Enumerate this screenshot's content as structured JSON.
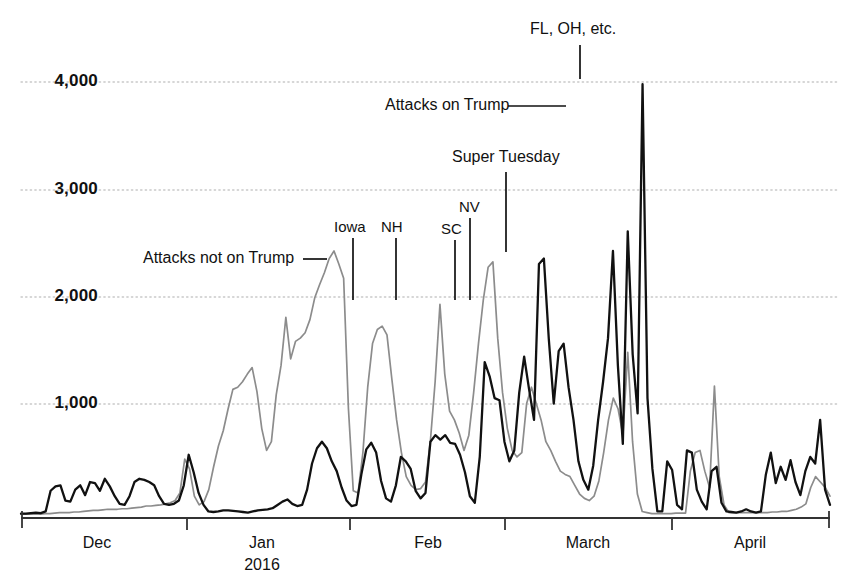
{
  "chart_data": {
    "type": "line",
    "title": "",
    "subtitle": "",
    "xlabel": "",
    "ylabel": "",
    "ylim": [
      0,
      4250
    ],
    "xlim": [
      0,
      160
    ],
    "grid": true,
    "legend_position": "inline-annotations",
    "y_ticks": [
      "1,000",
      "2,000",
      "3,000",
      "4,000"
    ],
    "y_tick_values": [
      1000,
      2000,
      3000,
      4000
    ],
    "x_ticks": [
      "Dec",
      "Jan",
      "Feb",
      "March",
      "April"
    ],
    "x_tick_sub": "2016",
    "x_tick_index": [
      6,
      37,
      68,
      97,
      128
    ],
    "colors": {
      "attacks_on_trump": "#111111",
      "attacks_not_on_trump": "#8c8c8c",
      "grid": "#c9c9c9",
      "axis": "#333333"
    },
    "series": [
      {
        "name": "Attacks on Trump",
        "color": "#111111",
        "values": [
          40,
          40,
          45,
          50,
          45,
          60,
          250,
          290,
          300,
          160,
          150,
          260,
          300,
          210,
          330,
          320,
          250,
          360,
          290,
          200,
          130,
          120,
          200,
          330,
          360,
          350,
          330,
          300,
          200,
          130,
          120,
          130,
          160,
          300,
          580,
          420,
          230,
          120,
          60,
          55,
          60,
          70,
          70,
          65,
          60,
          55,
          50,
          60,
          70,
          75,
          80,
          90,
          120,
          150,
          170,
          130,
          110,
          120,
          260,
          500,
          640,
          700,
          640,
          520,
          430,
          280,
          160,
          110,
          120,
          400,
          630,
          690,
          600,
          340,
          180,
          150,
          300,
          560,
          520,
          450,
          250,
          180,
          230,
          700,
          760,
          720,
          760,
          690,
          680,
          580,
          420,
          200,
          140,
          560,
          1430,
          1300,
          1100,
          1080,
          700,
          520,
          620,
          1150,
          1480,
          1180,
          900,
          2330,
          2380,
          1640,
          1050,
          1530,
          1600,
          1200,
          900,
          520,
          350,
          260,
          480,
          900,
          1250,
          1650,
          2450,
          1400,
          680,
          2630,
          1500,
          960,
          3980,
          1100,
          450,
          60,
          60,
          520,
          440,
          120,
          80,
          620,
          600,
          260,
          150,
          80,
          430,
          470,
          140,
          60,
          55,
          50,
          60,
          80,
          60,
          50,
          60,
          400,
          600,
          320,
          470,
          350,
          530,
          330,
          210,
          430,
          560,
          500,
          900,
          260,
          120
        ]
      },
      {
        "name": "Attacks not on Trump",
        "color": "#8c8c8c",
        "values": [
          35,
          35,
          35,
          35,
          35,
          40,
          40,
          45,
          50,
          50,
          50,
          55,
          55,
          60,
          65,
          70,
          70,
          75,
          80,
          80,
          80,
          85,
          85,
          90,
          95,
          100,
          110,
          110,
          115,
          120,
          130,
          140,
          160,
          230,
          540,
          450,
          200,
          120,
          150,
          260,
          470,
          660,
          800,
          1000,
          1180,
          1200,
          1250,
          1320,
          1380,
          1160,
          820,
          620,
          700,
          1130,
          1400,
          1840,
          1460,
          1620,
          1650,
          1700,
          1820,
          2020,
          2140,
          2250,
          2380,
          2450,
          2330,
          2200,
          1000,
          250,
          230,
          600,
          1200,
          1600,
          1730,
          1760,
          1680,
          1280,
          900,
          600,
          380,
          300,
          260,
          270,
          330,
          700,
          1250,
          1960,
          1320,
          980,
          900,
          780,
          620,
          760,
          1150,
          1600,
          2000,
          2300,
          2350,
          1650,
          1150,
          820,
          620,
          560,
          600,
          1050,
          1200,
          1050,
          900,
          700,
          620,
          520,
          430,
          400,
          380,
          300,
          220,
          180,
          160,
          200,
          340,
          600,
          900,
          1100,
          1000,
          760,
          1520,
          700,
          220,
          60,
          50,
          40,
          40,
          40,
          40,
          40,
          45,
          45,
          45,
          430,
          600,
          620,
          430,
          280,
          1210,
          380,
          120,
          50,
          50,
          50,
          50,
          50,
          50,
          50,
          50,
          50,
          55,
          55,
          60,
          60,
          70,
          80,
          100,
          130,
          280,
          380,
          330,
          280,
          200
        ]
      }
    ],
    "annotations": [
      {
        "id": "fl-oh-etc",
        "text": "FL, OH, etc.",
        "leader": "vertical"
      },
      {
        "id": "attacks-on-trump",
        "text": "Attacks on Trump",
        "leader": "horizontal"
      },
      {
        "id": "super-tuesday",
        "text": "Super Tuesday",
        "leader": "vertical"
      },
      {
        "id": "nv",
        "text": "NV",
        "leader": "vertical"
      },
      {
        "id": "sc",
        "text": "SC",
        "leader": "vertical"
      },
      {
        "id": "nh",
        "text": "NH",
        "leader": "vertical"
      },
      {
        "id": "iowa",
        "text": "Iowa",
        "leader": "vertical"
      },
      {
        "id": "attacks-not-on-trump",
        "text": "Attacks not on Trump",
        "leader": "horizontal"
      }
    ]
  },
  "axis": {
    "y_labels": [
      "4,000",
      "3,000",
      "2,000",
      "1,000"
    ],
    "x_labels": [
      "Dec",
      "Jan",
      "Feb",
      "March",
      "April"
    ],
    "x_year": "2016"
  },
  "annotations": {
    "fl_oh_etc": "FL, OH, etc.",
    "attacks_on_trump": "Attacks on Trump",
    "super_tuesday": "Super Tuesday",
    "nv": "NV",
    "sc": "SC",
    "nh": "NH",
    "iowa": "Iowa",
    "attacks_not_on_trump": "Attacks not on Trump"
  }
}
